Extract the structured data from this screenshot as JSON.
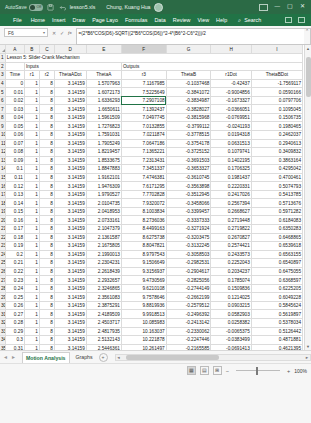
{
  "titlebar": {
    "autosave_label": "AutoSave",
    "autosave_state": "Off",
    "save_icon": "save-icon",
    "undo_icon": "undo-icon",
    "filename": "lesson5.xls",
    "username": "Chung, Kuang Hua",
    "avatar": "user-avatar",
    "ribbon_display_icon": "ribbon-display-options-icon",
    "minimize": "—",
    "maximize": "▢",
    "close": "✕"
  },
  "menubar": {
    "items": [
      "File",
      "Home",
      "Insert",
      "Draw",
      "Page Layo",
      "Formulas",
      "Data",
      "Review",
      "View",
      "Help"
    ],
    "search_icon": "search-icon",
    "search_label": "Search",
    "share_icon": "share-icon",
    "comments_icon": "comments-icon"
  },
  "formulabar": {
    "namebox_value": "F6",
    "namebox_caret": "▾",
    "cancel_icon": "✕",
    "confirm_icon": "✓",
    "fx_icon": "fx",
    "formula": "=(2*B6*COS(D6)-SQRT((2*B6*COS(D6))^2-4*(B6^2-C6^2)))/2",
    "expand_caret": "⌃"
  },
  "grid": {
    "columns": [
      "A",
      "B",
      "C",
      "D",
      "E",
      "F",
      "G",
      "H",
      "I"
    ],
    "selected_column": "F",
    "select_all_icon": "select-all-triangle",
    "active_cell": "F6",
    "title": "Lesson 5: Slider-Crank Mechanism",
    "section_inputs": "Inputs",
    "section_outputs": "Outputs",
    "headers": [
      "Time",
      "r1",
      "r2",
      "ThetaADot",
      "ThetaA",
      "r3",
      "ThetaB",
      "r1Dot",
      "ThetaBDot"
    ],
    "rows": [
      {
        "n": "4",
        "c": [
          "0",
          "1",
          "8",
          "3.14159",
          "1.5707963",
          "7.1167985",
          "-0.1037468",
          "-0.42437",
          "-1.7569117"
        ]
      },
      {
        "n": "5",
        "c": [
          "0.01",
          "1",
          "8",
          "3.14159",
          "1.6072173",
          "7.5225649",
          "-0.3841072",
          "-0.9004856",
          "0.0590166"
        ]
      },
      {
        "n": "6",
        "c": [
          "0.02",
          "1",
          "8",
          "3.14159",
          "1.6336293",
          "7.2907108",
          "-0.3834987",
          "-0.1673327",
          "0.0797706"
        ]
      },
      {
        "n": "7",
        "c": [
          "0.03",
          "1",
          "8",
          "3.14159",
          "1.6650611",
          "7.1392437",
          "-0.3828027",
          "-0.0366051",
          "0.1095045"
        ]
      },
      {
        "n": "8",
        "c": [
          "0.04",
          "1",
          "8",
          "3.14159",
          "1.5961509",
          "7.0497745",
          "-0.3815968",
          "-0.0769951",
          "0.1506735"
        ]
      },
      {
        "n": "9",
        "c": [
          "0.05",
          "1",
          "8",
          "3.14159",
          "1.7276823",
          "7.0132855",
          "-0.3799112",
          "-0.0241193",
          "0.1980465"
        ]
      },
      {
        "n": "10",
        "c": [
          "0.06",
          "1",
          "8",
          "3.14159",
          "1.7591031",
          "7.0211874",
          "-0.3778515",
          "0.0194318",
          "0.2462037"
        ]
      },
      {
        "n": "11",
        "c": [
          "0.07",
          "1",
          "8",
          "3.14159",
          "1.7905249",
          "7.0647186",
          "-0.3754178",
          "0.0631513",
          "0.2940613"
        ]
      },
      {
        "n": "12",
        "c": [
          "0.08",
          "1",
          "8",
          "3.14159",
          "1.8219457",
          "7.1365221",
          "-0.3725152",
          "0.1079741",
          "0.3409832"
        ]
      },
      {
        "n": "13",
        "c": [
          "0.09",
          "1",
          "8",
          "3.14159",
          "1.8533675",
          "7.2313431",
          "-0.3691503",
          "0.1402195",
          "0.3863164"
        ]
      },
      {
        "n": "14",
        "c": [
          "0.1",
          "1",
          "8",
          "3.14159",
          "1.8847883",
          "7.3451337",
          "-0.3653327",
          "0.1706325",
          "0.4295042"
        ]
      },
      {
        "n": "15",
        "c": [
          "0.11",
          "1",
          "8",
          "3.14159",
          "1.9162101",
          "7.4746381",
          "-0.3610745",
          "0.1981437",
          "0.4700461"
        ]
      },
      {
        "n": "16",
        "c": [
          "0.12",
          "1",
          "8",
          "3.14159",
          "1.9476309",
          "7.6171295",
          "-0.3563898",
          "0.2220331",
          "0.5074793"
        ]
      },
      {
        "n": "17",
        "c": [
          "0.13",
          "1",
          "8",
          "3.14159",
          "1.9790527",
          "7.7702828",
          "-0.3512945",
          "0.2417026",
          "0.5413785"
        ]
      },
      {
        "n": "18",
        "c": [
          "0.14",
          "1",
          "8",
          "3.14159",
          "2.0104735",
          "7.9320072",
          "-0.3458066",
          "0.2567394",
          "0.5713676"
        ]
      },
      {
        "n": "19",
        "c": [
          "0.15",
          "1",
          "8",
          "3.14159",
          "2.0418953",
          "8.1003834",
          "-0.3399457",
          "0.2668627",
          "0.5971282"
        ]
      },
      {
        "n": "20",
        "c": [
          "0.16",
          "1",
          "8",
          "3.14159",
          "2.0733161",
          "8.2736036",
          "-0.3337333",
          "0.2719448",
          "0.6184083"
        ]
      },
      {
        "n": "21",
        "c": [
          "0.17",
          "1",
          "8",
          "3.14159",
          "2.1047379",
          "8.4499163",
          "-0.3271924",
          "0.2719822",
          "0.6350283"
        ]
      },
      {
        "n": "22",
        "c": [
          "0.18",
          "1",
          "8",
          "3.14159",
          "2.1361587",
          "8.6275738",
          "-0.3203475",
          "0.2670827",
          "0.6468865"
        ]
      },
      {
        "n": "23",
        "c": [
          "0.19",
          "1",
          "8",
          "3.14159",
          "2.1675805",
          "8.8047821",
          "-0.3132245",
          "0.2574421",
          "0.6539618"
        ]
      },
      {
        "n": "24",
        "c": [
          "0.2",
          "1",
          "8",
          "3.14159",
          "2.1990013",
          "8.9797543",
          "-0.3058503",
          "0.2433573",
          "0.6563155"
        ]
      },
      {
        "n": "25",
        "c": [
          "0.21",
          "1",
          "8",
          "3.14159",
          "2.2304231",
          "9.1506649",
          "-0.2982531",
          "0.2252043",
          "0.6540897"
        ]
      },
      {
        "n": "26",
        "c": [
          "0.22",
          "1",
          "8",
          "3.14159",
          "2.2618439",
          "9.3156937",
          "-0.2904617",
          "0.2034237",
          "0.6475055"
        ]
      },
      {
        "n": "27",
        "c": [
          "0.23",
          "1",
          "8",
          "3.14159",
          "2.2932657",
          "9.4730569",
          "-0.2825056",
          "0.1785074",
          "0.6368597"
        ]
      },
      {
        "n": "28",
        "c": [
          "0.24",
          "1",
          "8",
          "3.14159",
          "2.3246865",
          "9.6210108",
          "-0.2744149",
          "0.1509836",
          "0.6225205"
        ]
      },
      {
        "n": "29",
        "c": [
          "0.25",
          "1",
          "8",
          "3.14159",
          "2.3561083",
          "9.7578646",
          "-0.2662199",
          "0.1214025",
          "0.6049228"
        ]
      },
      {
        "n": "30",
        "c": [
          "0.26",
          "1",
          "8",
          "3.14159",
          "2.3875291",
          "9.8819936",
          "-0.2579512",
          "0.0903215",
          "0.5845624"
        ]
      },
      {
        "n": "31",
        "c": [
          "0.27",
          "1",
          "8",
          "3.14159",
          "2.4189509",
          "9.9918513",
          "-0.2496392",
          "0.0582903",
          "0.5619897"
        ]
      },
      {
        "n": "32",
        "c": [
          "0.28",
          "1",
          "8",
          "3.14159",
          "2.4503717",
          "10.085983",
          "-0.2413142",
          "0.0258382",
          "0.5378034"
        ]
      },
      {
        "n": "33",
        "c": [
          "0.29",
          "1",
          "8",
          "3.14159",
          "2.4817935",
          "10.163037",
          "-0.2330062",
          "-0.0065375",
          "0.5126442"
        ]
      },
      {
        "n": "34",
        "c": [
          "0.3",
          "1",
          "8",
          "3.14159",
          "2.5132143",
          "10.221878",
          "-0.2247446",
          "-0.0383499",
          "0.4871881"
        ]
      },
      {
        "n": "35",
        "c": [
          "0.31",
          "1",
          "8",
          "3.14159",
          "2.5446361",
          "10.261497",
          "-0.2165585",
          "-0.0691413",
          "0.4621395"
        ]
      },
      {
        "n": "36",
        "c": [
          "0.32",
          "1",
          "8",
          "3.14159",
          "2.5760569",
          "10.281021",
          "-0.2084764",
          "-0.0984915",
          "0.4382223"
        ]
      },
      {
        "n": "37",
        "c": [
          "0.33",
          "1",
          "8",
          "3.14159",
          "2.6073213",
          "2.2706653",
          "-0.1920696",
          "-2.2260393",
          "1.0303250"
        ]
      }
    ]
  },
  "tabs": {
    "prev_icon": "◄",
    "next_icon": "►",
    "sheets": [
      "Motion Analysis",
      "Graphs"
    ],
    "active_sheet": "Motion Analysis",
    "add_sheet_icon": "+"
  },
  "statusbar": {
    "message": "",
    "view_normal_icon": "normal-view-icon",
    "view_layout_icon": "page-layout-icon",
    "view_break_icon": "page-break-preview-icon",
    "zoom_out": "−",
    "zoom_in": "+",
    "zoom_level": "100%"
  }
}
